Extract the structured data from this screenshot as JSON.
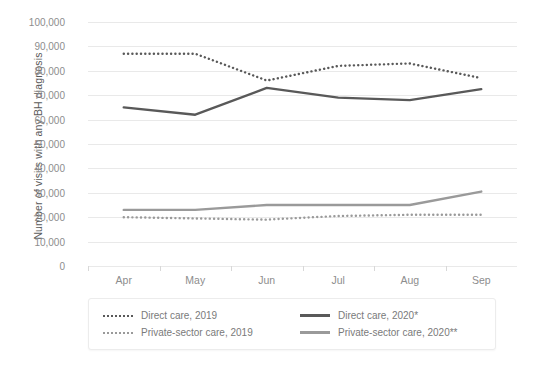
{
  "chart_data": {
    "type": "line",
    "title": "",
    "xlabel": "",
    "ylabel": "Number of visits with any BH diagnosis",
    "categories": [
      "Apr",
      "May",
      "Jun",
      "Jul",
      "Aug",
      "Sep"
    ],
    "ylim": [
      0,
      100000
    ],
    "ytick_labels": [
      "100,000",
      "90,000",
      "80,000",
      "70,000",
      "60,000",
      "50,000",
      "40,000",
      "30,000",
      "20,000",
      "10,000",
      "0"
    ],
    "ytick_values": [
      100000,
      90000,
      80000,
      70000,
      60000,
      50000,
      40000,
      30000,
      20000,
      10000,
      0
    ],
    "grid": true,
    "legend_position": "bottom",
    "series": [
      {
        "name": "Direct care, 2019",
        "style": "dotted",
        "color": "#595959",
        "values": [
          87000,
          87000,
          76000,
          82000,
          83000,
          77000
        ]
      },
      {
        "name": "Direct care, 2020*",
        "style": "solid",
        "color": "#595959",
        "values": [
          65000,
          62000,
          73000,
          69000,
          68000,
          72500
        ]
      },
      {
        "name": "Private-sector care, 2019",
        "style": "dotted",
        "color": "#9a9a9a",
        "values": [
          20000,
          19500,
          19000,
          20500,
          21000,
          21000
        ]
      },
      {
        "name": "Private-sector care, 2020**",
        "style": "solid",
        "color": "#9a9a9a",
        "values": [
          23000,
          23000,
          25000,
          25000,
          25000,
          30500
        ]
      }
    ]
  },
  "legend": {
    "entries": [
      {
        "label": "Direct care, 2019",
        "swatch": "dotted-dark"
      },
      {
        "label": "Direct care, 2020*",
        "swatch": "solid-dark"
      },
      {
        "label": "Private-sector care, 2019",
        "swatch": "dotted-grey"
      },
      {
        "label": "Private-sector care, 2020**",
        "swatch": "solid-grey"
      }
    ]
  },
  "colors": {
    "direct_care": "#595959",
    "private_sector_care": "#9a9a9a",
    "gridline": "#e9e9e9",
    "tick_text": "#8d8d8d",
    "axis_title": "#5a5a5a"
  }
}
